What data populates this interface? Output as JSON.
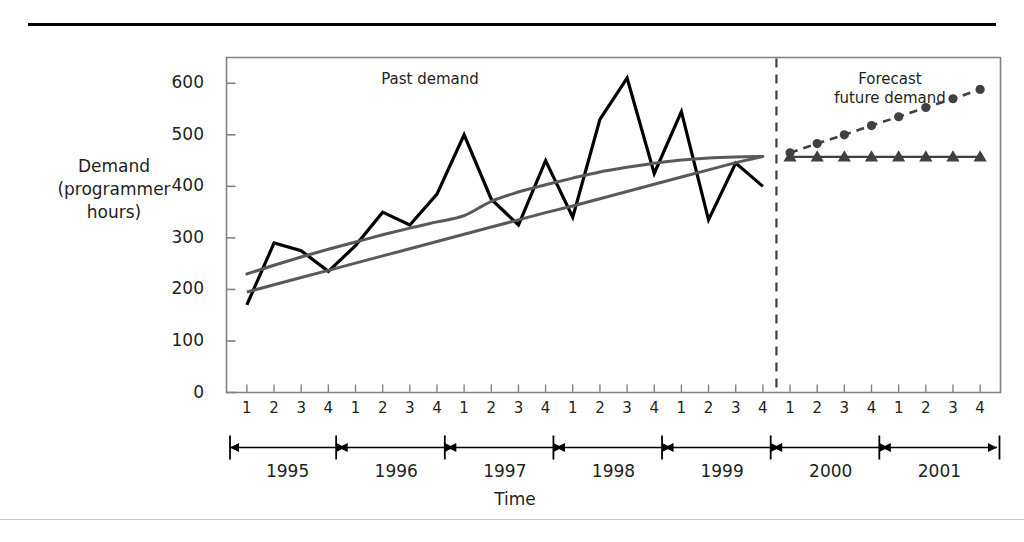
{
  "figure": {
    "y_axis_title": [
      "Demand",
      "(programmer",
      "hours)"
    ],
    "x_axis_title": "Time",
    "past_label": "Past demand",
    "forecast_label": [
      "Forecast",
      "future demand"
    ]
  },
  "chart_data": {
    "type": "line",
    "title": "",
    "xlabel": "Time",
    "ylabel": "Demand (programmer hours)",
    "ylim": [
      0,
      650
    ],
    "yticks": [
      0,
      100,
      200,
      300,
      400,
      500,
      600
    ],
    "grid": false,
    "legend": "none",
    "annotations": [
      "Past demand",
      "Forecast future demand"
    ],
    "divider": {
      "label": "forecast-start",
      "after_x": "1999 Q4"
    },
    "years": [
      1995,
      1996,
      1997,
      1998,
      1999,
      2000,
      2001
    ],
    "quarters": [
      1,
      2,
      3,
      4
    ],
    "x": [
      "1995 Q1",
      "1995 Q2",
      "1995 Q3",
      "1995 Q4",
      "1996 Q1",
      "1996 Q2",
      "1996 Q3",
      "1996 Q4",
      "1997 Q1",
      "1997 Q2",
      "1997 Q3",
      "1997 Q4",
      "1998 Q1",
      "1998 Q2",
      "1998 Q3",
      "1998 Q4",
      "1999 Q1",
      "1999 Q2",
      "1999 Q3",
      "1999 Q4",
      "2000 Q1",
      "2000 Q2",
      "2000 Q3",
      "2000 Q4",
      "2001 Q1",
      "2001 Q2",
      "2001 Q3",
      "2001 Q4"
    ],
    "series": [
      {
        "name": "Past demand",
        "style": "solid-jagged",
        "color": "#000000",
        "marker": "none",
        "values": [
          170,
          290,
          275,
          235,
          285,
          350,
          325,
          385,
          500,
          375,
          325,
          450,
          340,
          530,
          610,
          425,
          545,
          335,
          445,
          400,
          null,
          null,
          null,
          null,
          null,
          null,
          null,
          null
        ]
      },
      {
        "name": "Linear trend",
        "style": "solid-straight",
        "color": "#58595b",
        "marker": "none",
        "values": [
          195,
          209,
          223,
          237,
          251,
          265,
          279,
          293,
          307,
          321,
          335,
          349,
          362,
          376,
          390,
          404,
          418,
          432,
          446,
          458,
          null,
          null,
          null,
          null,
          null,
          null,
          null,
          null
        ]
      },
      {
        "name": "Curved trend",
        "style": "solid-curve",
        "color": "#58595b",
        "marker": "none",
        "values": [
          230,
          247,
          263,
          278,
          292,
          306,
          319,
          331,
          343,
          371,
          389,
          403,
          416,
          428,
          437,
          445,
          451,
          455,
          457,
          458,
          null,
          null,
          null,
          null,
          null,
          null,
          null,
          null
        ]
      },
      {
        "name": "Forecast future demand (trend)",
        "style": "dashed",
        "color": "#3f4044",
        "marker": "circle",
        "values": [
          null,
          null,
          null,
          null,
          null,
          null,
          null,
          null,
          null,
          null,
          null,
          null,
          null,
          null,
          null,
          null,
          null,
          null,
          null,
          null,
          465,
          483,
          500,
          518,
          535,
          553,
          570,
          588
        ]
      },
      {
        "name": "Forecast future demand (flat)",
        "style": "solid-thin",
        "color": "#3f4044",
        "marker": "triangle",
        "values": [
          null,
          null,
          null,
          null,
          null,
          null,
          null,
          null,
          null,
          null,
          null,
          null,
          null,
          null,
          null,
          null,
          null,
          null,
          null,
          null,
          457,
          457,
          457,
          457,
          457,
          457,
          457,
          457
        ]
      }
    ]
  }
}
